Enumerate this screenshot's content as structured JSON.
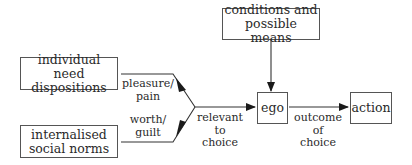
{
  "diagram": {
    "nodes": {
      "individual_need": "individual need dispositions",
      "internalised_norms": "internalised social norms",
      "conditions": "conditions and possible means",
      "ego": "ego",
      "action": "action"
    },
    "node_lines": {
      "individual_need": [
        "individual need",
        "dispositions"
      ],
      "internalised_norms": [
        "internalised",
        "social norms"
      ],
      "conditions": [
        "conditions and",
        "possible means"
      ]
    },
    "edge_labels": {
      "pleasure_pain": [
        "pleasure/",
        "pain"
      ],
      "worth_guilt": [
        "worth/",
        "guilt"
      ],
      "relevant_to_choice": [
        "relevant",
        "to",
        "choice"
      ],
      "outcome_of_choice": [
        "outcome",
        "of",
        "choice"
      ]
    },
    "edges": [
      {
        "from": "individual need dispositions",
        "to": "junction",
        "label": "pleasure/pain"
      },
      {
        "from": "internalised social norms",
        "to": "junction",
        "label": "worth/guilt"
      },
      {
        "from": "junction",
        "to": "ego",
        "label": "relevant to choice"
      },
      {
        "from": "conditions and possible means",
        "to": "ego",
        "label": ""
      },
      {
        "from": "ego",
        "to": "action",
        "label": "outcome of choice"
      }
    ]
  }
}
